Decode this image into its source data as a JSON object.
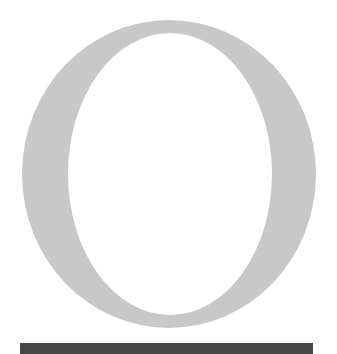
{
  "glyph": {
    "letter": "O",
    "color": "#c8c8c8",
    "outer": {
      "cx": 169,
      "cy": 174,
      "rx": 147,
      "ry": 154
    },
    "inner": {
      "cx": 170,
      "cy": 174,
      "rx": 102,
      "ry": 141
    }
  },
  "bar": {
    "color": "#454545"
  }
}
